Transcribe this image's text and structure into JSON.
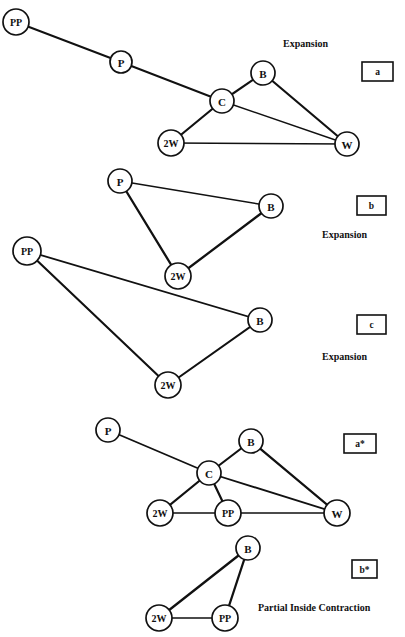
{
  "figure": {
    "width": 405,
    "height": 637,
    "background": "#ffffff",
    "ink_color": "#111111",
    "node_fill": "#ffffff"
  },
  "panels": [
    {
      "id": "panel-a",
      "tag": "a",
      "tag_box": {
        "x": 362,
        "y": 62,
        "w": 31,
        "h": 19
      },
      "caption": "Expansion",
      "caption_pos": {
        "x": 283,
        "y": 43
      },
      "nodes": [
        {
          "id": "PP",
          "label": "PP",
          "x": 16,
          "y": 22,
          "r": 13,
          "font_size": 10
        },
        {
          "id": "P",
          "label": "P",
          "x": 121,
          "y": 62,
          "r": 11,
          "font_size": 11
        },
        {
          "id": "C",
          "label": "C",
          "x": 222,
          "y": 101,
          "r": 12,
          "font_size": 11
        },
        {
          "id": "B",
          "label": "B",
          "x": 263,
          "y": 73,
          "r": 12,
          "font_size": 11
        },
        {
          "id": "W",
          "label": "W",
          "x": 347,
          "y": 144,
          "r": 12,
          "font_size": 11
        },
        {
          "id": "2W",
          "label": "2W",
          "x": 171,
          "y": 143,
          "r": 13,
          "font_size": 10
        }
      ],
      "edges": [
        {
          "from": "PP",
          "to": "P",
          "w": 1.9
        },
        {
          "from": "P",
          "to": "C",
          "w": 1.9
        },
        {
          "from": "C",
          "to": "W",
          "w": 1.4
        },
        {
          "from": "C",
          "to": "B",
          "w": 2.2
        },
        {
          "from": "C",
          "to": "2W",
          "w": 2.2
        },
        {
          "from": "B",
          "to": "W",
          "w": 2.2
        },
        {
          "from": "2W",
          "to": "W",
          "w": 1.4
        }
      ]
    },
    {
      "id": "panel-b",
      "tag": "b",
      "tag_box": {
        "x": 357,
        "y": 196,
        "w": 29,
        "h": 19
      },
      "caption": "Expansion",
      "caption_pos": {
        "x": 322,
        "y": 234
      },
      "nodes": [
        {
          "id": "P",
          "label": "P",
          "x": 120,
          "y": 181,
          "r": 12,
          "font_size": 11
        },
        {
          "id": "B",
          "label": "B",
          "x": 271,
          "y": 206,
          "r": 12,
          "font_size": 11
        },
        {
          "id": "2W",
          "label": "2W",
          "x": 178,
          "y": 276,
          "r": 13,
          "font_size": 10
        }
      ],
      "edges": [
        {
          "from": "P",
          "to": "B",
          "w": 1.4
        },
        {
          "from": "P",
          "to": "2W",
          "w": 2.3
        },
        {
          "from": "B",
          "to": "2W",
          "w": 2.3
        }
      ]
    },
    {
      "id": "panel-c",
      "tag": "c",
      "tag_box": {
        "x": 357,
        "y": 315,
        "w": 29,
        "h": 19
      },
      "caption": "Expansion",
      "caption_pos": {
        "x": 322,
        "y": 356
      },
      "nodes": [
        {
          "id": "PP",
          "label": "PP",
          "x": 27,
          "y": 251,
          "r": 14,
          "font_size": 10
        },
        {
          "id": "B",
          "label": "B",
          "x": 260,
          "y": 320,
          "r": 12,
          "font_size": 11
        },
        {
          "id": "2W",
          "label": "2W",
          "x": 168,
          "y": 385,
          "r": 13,
          "font_size": 10
        }
      ],
      "edges": [
        {
          "from": "PP",
          "to": "B",
          "w": 1.8
        },
        {
          "from": "PP",
          "to": "2W",
          "w": 2.1
        },
        {
          "from": "B",
          "to": "2W",
          "w": 2.1
        }
      ]
    },
    {
      "id": "panel-a-star",
      "tag": "a*",
      "tag_box": {
        "x": 344,
        "y": 434,
        "w": 32,
        "h": 19
      },
      "caption": "",
      "caption_pos": {
        "x": 0,
        "y": 0
      },
      "nodes": [
        {
          "id": "P",
          "label": "P",
          "x": 108,
          "y": 430,
          "r": 12,
          "font_size": 11
        },
        {
          "id": "B",
          "label": "B",
          "x": 251,
          "y": 441,
          "r": 12,
          "font_size": 11
        },
        {
          "id": "C",
          "label": "C",
          "x": 209,
          "y": 473,
          "r": 12,
          "font_size": 11
        },
        {
          "id": "2W",
          "label": "2W",
          "x": 160,
          "y": 513,
          "r": 13,
          "font_size": 10
        },
        {
          "id": "PP",
          "label": "PP",
          "x": 228,
          "y": 513,
          "r": 13,
          "font_size": 10
        },
        {
          "id": "W",
          "label": "W",
          "x": 337,
          "y": 513,
          "r": 13,
          "font_size": 11
        }
      ],
      "edges": [
        {
          "from": "P",
          "to": "C",
          "w": 1.8
        },
        {
          "from": "C",
          "to": "B",
          "w": 2.2
        },
        {
          "from": "C",
          "to": "2W",
          "w": 2.2
        },
        {
          "from": "C",
          "to": "PP",
          "w": 2.2
        },
        {
          "from": "C",
          "to": "W",
          "w": 1.8
        },
        {
          "from": "B",
          "to": "W",
          "w": 2.2
        },
        {
          "from": "2W",
          "to": "PP",
          "w": 1.3
        },
        {
          "from": "PP",
          "to": "W",
          "w": 1.3
        }
      ]
    },
    {
      "id": "panel-b-star",
      "tag": "b*",
      "tag_box": {
        "x": 352,
        "y": 560,
        "w": 25,
        "h": 18
      },
      "caption": "Partial Inside Contraction",
      "caption_pos": {
        "x": 258,
        "y": 607
      },
      "nodes": [
        {
          "id": "B",
          "label": "B",
          "x": 248,
          "y": 548,
          "r": 12,
          "font_size": 11
        },
        {
          "id": "2W",
          "label": "2W",
          "x": 159,
          "y": 618,
          "r": 13,
          "font_size": 10
        },
        {
          "id": "PP",
          "label": "PP",
          "x": 225,
          "y": 618,
          "r": 13,
          "font_size": 10
        }
      ],
      "edges": [
        {
          "from": "B",
          "to": "2W",
          "w": 2.3
        },
        {
          "from": "B",
          "to": "PP",
          "w": 2.3
        },
        {
          "from": "2W",
          "to": "PP",
          "w": 1.4
        }
      ]
    }
  ]
}
